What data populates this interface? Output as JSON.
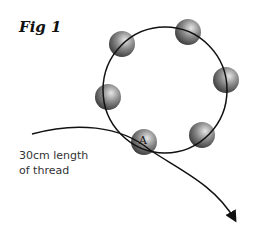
{
  "figure": {
    "title": "Fig 1",
    "thread_label_line1": "30cm length",
    "thread_label_line2": "of thread",
    "bead_marker": "A",
    "bead_count": 6
  },
  "colors": {
    "line": "#111111",
    "bead_light": "#d8d8d8",
    "bead_dark": "#3a3a3a"
  }
}
